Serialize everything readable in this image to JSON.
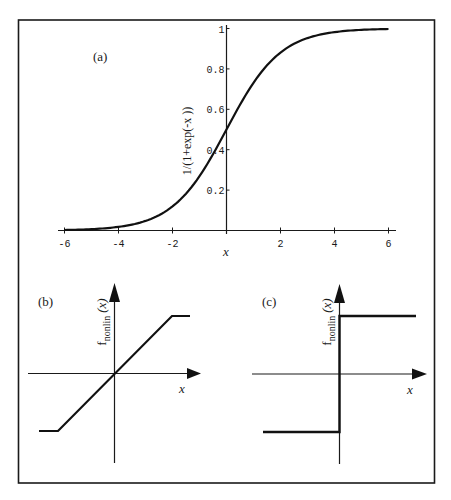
{
  "chart_data": [
    {
      "panel": "(a)",
      "type": "line",
      "title": "",
      "panel_label": "(a)",
      "xlabel": "x",
      "ylabel": "1/(1+exp(-x ))",
      "xlim": [
        -6,
        6
      ],
      "ylim": [
        0,
        1
      ],
      "x_ticks": [
        -6,
        -4,
        -2,
        2,
        4,
        6
      ],
      "x_tick_labels": [
        "-6",
        "-4",
        "-2",
        "2",
        "4",
        "6"
      ],
      "y_ticks": [
        0.2,
        0.4,
        0.6,
        0.8,
        1
      ],
      "y_tick_labels": [
        "0.2",
        "0.4",
        "0.6",
        "0.8",
        "1"
      ],
      "grid": false,
      "legend": "none",
      "series": [
        {
          "name": "sigmoid",
          "function": "1/(1+exp(-x))",
          "x": [
            -6,
            -5,
            -4,
            -3,
            -2,
            -1,
            0,
            1,
            2,
            3,
            4,
            5,
            6
          ],
          "y": [
            0.002,
            0.007,
            0.018,
            0.047,
            0.119,
            0.269,
            0.5,
            0.731,
            0.881,
            0.953,
            0.982,
            0.993,
            0.998
          ]
        }
      ]
    },
    {
      "panel": "(b)",
      "type": "line",
      "panel_label": "(b)",
      "xlabel": "x",
      "ylabel_main": "f",
      "ylabel_sub": "nonlin",
      "ylabel_arg": "(x)",
      "description": "piecewise linear (saturating ramp)",
      "series": [
        {
          "name": "ramp",
          "x": [
            -1.4,
            -1.0,
            1.0,
            1.4
          ],
          "y": [
            -1,
            -1,
            1,
            1
          ]
        }
      ]
    },
    {
      "panel": "(c)",
      "type": "line",
      "panel_label": "(c)",
      "xlabel": "x",
      "ylabel_main": "f",
      "ylabel_sub": "nonlin",
      "ylabel_arg": "(x)",
      "description": "hard-limit step function",
      "series": [
        {
          "name": "step",
          "x": [
            -1.3,
            0,
            0,
            1.3
          ],
          "y": [
            -1,
            -1,
            1,
            1
          ]
        }
      ]
    }
  ]
}
